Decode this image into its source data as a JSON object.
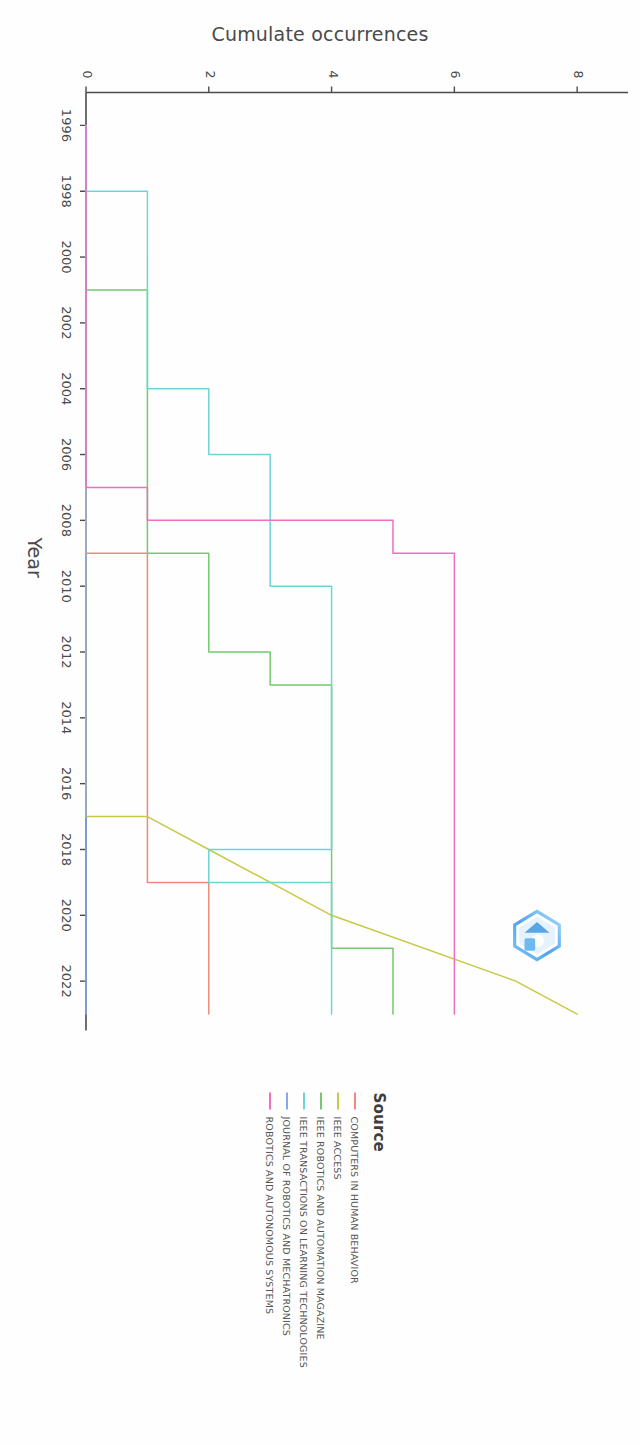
{
  "chart_data": {
    "type": "line",
    "title": "",
    "xlabel": "Year",
    "ylabel": "Cumulate occurrences",
    "xlim": [
      1995,
      2023.5
    ],
    "ylim": [
      0,
      8.6
    ],
    "xticks": [
      1996,
      1998,
      2000,
      2002,
      2004,
      2006,
      2008,
      2010,
      2012,
      2014,
      2016,
      2018,
      2020,
      2022
    ],
    "yticks": [
      0,
      2,
      4,
      6,
      8
    ],
    "grid": false,
    "legend_position": "right",
    "legend_title": "Source",
    "series": [
      {
        "name": "COMPUTERS IN HUMAN BEHAVIOR",
        "color": "#f08a7a",
        "x": [
          1996,
          2009,
          2009,
          2018,
          2018,
          2019,
          2019,
          2023
        ],
        "y": [
          0,
          0,
          1,
          1,
          1,
          1,
          2,
          2
        ]
      },
      {
        "name": "IEEE ACCESS",
        "color": "#c9c84a",
        "x": [
          1996,
          2017,
          2017,
          2018,
          2018,
          2020,
          2020,
          2022,
          2022,
          2023
        ],
        "y": [
          0,
          0,
          1,
          2,
          2,
          4,
          4,
          7,
          7,
          8
        ]
      },
      {
        "name": "IEEE ROBOTICS AND AUTOMATION MAGAZINE",
        "color": "#76c96e",
        "x": [
          1996,
          2001,
          2001,
          2009,
          2009,
          2012,
          2012,
          2013,
          2013,
          2016,
          2016,
          2021,
          2021,
          2023
        ],
        "y": [
          0,
          0,
          1,
          1,
          2,
          2,
          3,
          3,
          4,
          4,
          4,
          4,
          5,
          5
        ]
      },
      {
        "name": "IEEE TRANSACTIONS ON LEARNING TECHNOLOGIES",
        "color": "#6fd3d8",
        "x": [
          1996,
          1998,
          1998,
          2004,
          2004,
          2006,
          2006,
          2008,
          2008,
          2010,
          2010,
          2018,
          2018,
          2019,
          2019,
          2022,
          2022,
          2023
        ],
        "y": [
          0,
          0,
          1,
          1,
          2,
          2,
          3,
          3,
          3,
          3,
          4,
          4,
          2,
          2,
          4,
          4,
          4,
          4
        ]
      },
      {
        "name": "JOURNAL OF ROBOTICS AND MECHATRONICS",
        "color": "#8aa8e8",
        "x": [
          1996,
          2023
        ],
        "y": [
          0,
          0
        ]
      },
      {
        "name": "ROBOTICS AND AUTONOMOUS SYSTEMS",
        "color": "#ef6fc0",
        "x": [
          1996,
          2007,
          2007,
          2008,
          2008,
          2009,
          2009,
          2023
        ],
        "y": [
          0,
          0,
          1,
          1,
          5,
          5,
          6,
          6
        ]
      }
    ]
  },
  "legend": {
    "title": "Source",
    "items": [
      {
        "label": "COMPUTERS IN HUMAN BEHAVIOR",
        "color": "#f08a7a"
      },
      {
        "label": "IEEE ACCESS",
        "color": "#c9c84a"
      },
      {
        "label": "IEEE ROBOTICS AND AUTOMATION MAGAZINE",
        "color": "#76c96e"
      },
      {
        "label": "IEEE TRANSACTIONS ON LEARNING TECHNOLOGIES",
        "color": "#6fd3d8"
      },
      {
        "label": "JOURNAL OF ROBOTICS AND MECHATRONICS",
        "color": "#8aa8e8"
      },
      {
        "label": "ROBOTICS AND AUTONOMOUS SYSTEMS",
        "color": "#ef6fc0"
      }
    ]
  },
  "axes": {
    "x_title": "Year",
    "y_title": "Cumulate occurrences"
  },
  "watermark": {
    "name": "hexagon-logo-watermark",
    "color": "#4aa8f0"
  }
}
